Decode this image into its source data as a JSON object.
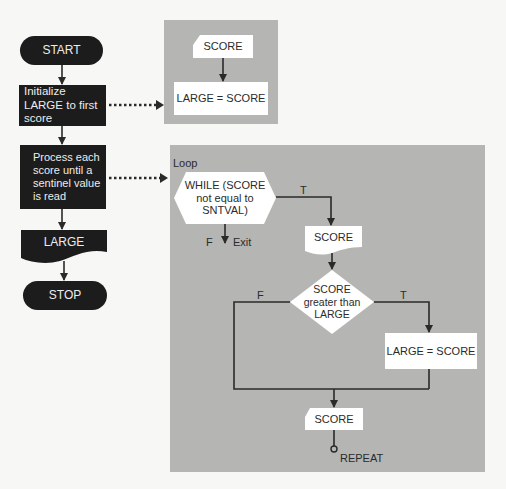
{
  "colors": {
    "background": "#f7f7f5",
    "panel": "#b5b5b3",
    "dark_shape": "#1c1c1c",
    "light_shape": "#ffffff",
    "line": "#2a2a2a"
  },
  "main_flow": {
    "start": "START",
    "initialize": "Initialize LARGE to first score",
    "process": "Process each score until a sentinel value is read",
    "output": "LARGE",
    "stop": "STOP"
  },
  "init_detail": {
    "input": "SCORE",
    "assign": "LARGE = SCORE"
  },
  "loop_detail": {
    "title": "Loop",
    "while_condition": "WHILE (SCORE not equal to SNTVAL)",
    "while_true_label": "T",
    "while_false_label": "F",
    "exit_label": "Exit",
    "read_score": "SCORE",
    "if_condition": "SCORE greater than LARGE",
    "if_true_label": "T",
    "if_false_label": "F",
    "assign": "LARGE = SCORE",
    "read_next": "SCORE",
    "repeat_label": "REPEAT"
  }
}
